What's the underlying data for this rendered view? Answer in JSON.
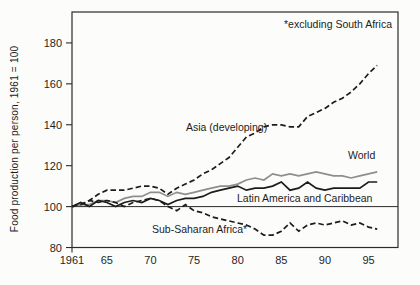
{
  "figure": {
    "background": "#fcfcfa"
  },
  "chart_data": {
    "type": "line",
    "title": "",
    "ylabel": "Food production per person, 1961 = 100",
    "annotation": "*excluding South Africa",
    "xlabel": "",
    "x_start_year": 1961,
    "x_end_year": 1996,
    "xlim": [
      1961,
      1998.4
    ],
    "ylim": [
      80,
      195
    ],
    "y_ticks": [
      180,
      160,
      140,
      120,
      100,
      80
    ],
    "x_ticks": [
      {
        "label": "1961",
        "year": 1961
      },
      {
        "label": "65",
        "year": 1965
      },
      {
        "label": "70",
        "year": 1970
      },
      {
        "label": "75",
        "year": 1975
      },
      {
        "label": "80",
        "year": 1980
      },
      {
        "label": "85",
        "year": 1985
      },
      {
        "label": "90",
        "year": 1990
      },
      {
        "label": "95",
        "year": 1995
      }
    ],
    "reference_line": 100,
    "grid": false,
    "legend_position": "labels-on-lines",
    "colors": {
      "black_line": "#1c1c1c",
      "gray_line": "#8e8e8e",
      "frame": "#2b2b2b"
    },
    "series": [
      {
        "id": "asia",
        "name": "Asia (developing)",
        "style": "dashed",
        "color": "#1c1c1c",
        "values": [
          100,
          101,
          103,
          106,
          108,
          108,
          108,
          109,
          110,
          110,
          109,
          106,
          109,
          111,
          113,
          116,
          118,
          121,
          124,
          129,
          134,
          136,
          139,
          140,
          140,
          139,
          139,
          144,
          146,
          148,
          151,
          153,
          156,
          160,
          165,
          169
        ]
      },
      {
        "id": "world",
        "name": "World",
        "style": "solid",
        "color": "#8e8e8e",
        "values": [
          100,
          101,
          101,
          103,
          103,
          102,
          104,
          105,
          105,
          107,
          107,
          105,
          107,
          106,
          107,
          108,
          109,
          110,
          110,
          111,
          113,
          114,
          113,
          116,
          115,
          116,
          115,
          116,
          117,
          116,
          115,
          115,
          114,
          115,
          116,
          117
        ]
      },
      {
        "id": "latam",
        "name": "Latin America and Caribbean",
        "style": "solid",
        "color": "#1c1c1c",
        "values": [
          100,
          102,
          100,
          103,
          102,
          100,
          102,
          103,
          102,
          104,
          103,
          101,
          103,
          104,
          104,
          105,
          107,
          108,
          109,
          110,
          108,
          109,
          109,
          110,
          112,
          108,
          109,
          112,
          109,
          108,
          109,
          109,
          109,
          109,
          112,
          112
        ]
      },
      {
        "id": "ssa",
        "name": "Sub-Saharan Africa*",
        "style": "dashed",
        "color": "#1c1c1c",
        "values": [
          100,
          101,
          103,
          102,
          103,
          102,
          100,
          102,
          103,
          104,
          103,
          100,
          98,
          101,
          98,
          97,
          95,
          94,
          93,
          92,
          91,
          89,
          86,
          86,
          88,
          92,
          88,
          91,
          92,
          91,
          92,
          93,
          91,
          92,
          90,
          89
        ]
      }
    ]
  }
}
